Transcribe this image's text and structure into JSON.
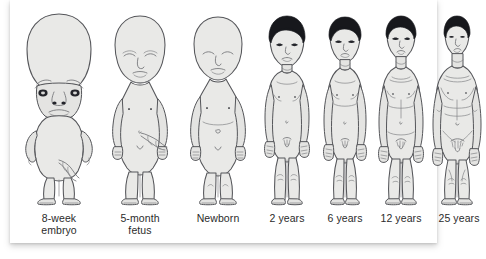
{
  "figure": {
    "card_background": "#ffffff",
    "body_fill": "#e9e9e7",
    "outline_color": "#55565a",
    "hair_color": "#17181c",
    "label_color": "#2b2b2b"
  },
  "stages": [
    {
      "id": "embryo-8-week",
      "label": "8-week\nembryo",
      "label_line1": "8-week",
      "label_line2": "embryo",
      "has_hair": false,
      "head_to_body_note": "head about one half of total body length"
    },
    {
      "id": "fetus-5-month",
      "label": "5-month\nfetus",
      "label_line1": "5-month",
      "label_line2": "fetus",
      "has_hair": false,
      "head_to_body_note": "head about one third of total body length"
    },
    {
      "id": "newborn",
      "label": "Newborn",
      "label_line1": "Newborn",
      "label_line2": "",
      "has_hair": false,
      "head_to_body_note": "head about one quarter of total body length"
    },
    {
      "id": "age-2-years",
      "label": "2 years",
      "label_line1": "2 years",
      "label_line2": "",
      "has_hair": true,
      "head_to_body_note": "head about one fifth of total body length"
    },
    {
      "id": "age-6-years",
      "label": "6 years",
      "label_line1": "6 years",
      "label_line2": "",
      "has_hair": true,
      "head_to_body_note": "head about one sixth of total body length"
    },
    {
      "id": "age-12-years",
      "label": "12 years",
      "label_line1": "12 years",
      "label_line2": "",
      "has_hair": true,
      "head_to_body_note": "head about one seventh of total body length"
    },
    {
      "id": "age-25-years",
      "label": "25 years",
      "label_line1": "25 years",
      "label_line2": "",
      "has_hair": true,
      "head_to_body_note": "head about one eighth of total body length"
    }
  ]
}
